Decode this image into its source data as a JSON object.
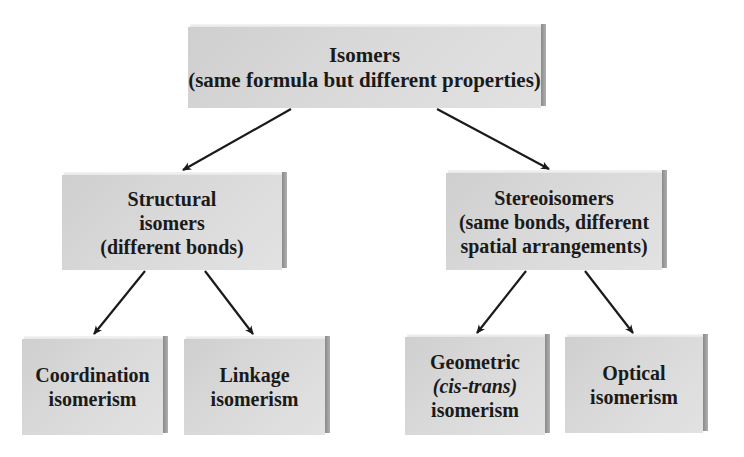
{
  "diagram": {
    "root": {
      "lines": [
        "Isomers",
        "(same formula but different properties)"
      ]
    },
    "branches": [
      {
        "lines": [
          "Structural",
          "isomers",
          "(different bonds)"
        ],
        "children": [
          {
            "lines": [
              "Coordination",
              "isomerism"
            ]
          },
          {
            "lines": [
              "Linkage",
              "isomerism"
            ]
          }
        ]
      },
      {
        "lines": [
          "Stereoisomers",
          "(same bonds, different",
          "spatial arrangements)"
        ],
        "children": [
          {
            "lines": [
              "Geometric",
              "(cis-trans)",
              "isomerism"
            ]
          },
          {
            "lines": [
              "Optical",
              "isomerism"
            ]
          }
        ]
      }
    ],
    "colors": {
      "box_face": "#d6d6d6",
      "box_side": "#8a8a8a",
      "box_top": "#eeeeee",
      "text": "#1a1a1a",
      "arrow": "#1a1a1a",
      "background": "#ffffff"
    }
  }
}
